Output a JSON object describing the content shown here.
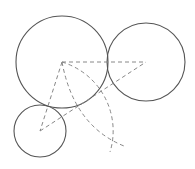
{
  "diagram": {
    "width": 195,
    "height": 169,
    "stroke_color": "#555555",
    "dash_color": "#888888",
    "circles": [
      {
        "id": "large",
        "cx": 62,
        "cy": 62,
        "r": 46
      },
      {
        "id": "right",
        "cx": 146,
        "cy": 62,
        "r": 39
      },
      {
        "id": "small",
        "cx": 40,
        "cy": 131,
        "r": 26
      }
    ],
    "dashed_lines": [
      {
        "x1": 62,
        "y1": 62,
        "x2": 146,
        "y2": 62
      },
      {
        "x1": 62,
        "y1": 62,
        "x2": 40,
        "y2": 131
      },
      {
        "x1": 40,
        "y1": 131,
        "x2": 146,
        "y2": 62
      }
    ],
    "dashed_arcs": [
      {
        "d": "M62,62 A72,72 0 0,1 110,152"
      },
      {
        "d": "M62,62 Q74,126 124,146"
      }
    ]
  }
}
